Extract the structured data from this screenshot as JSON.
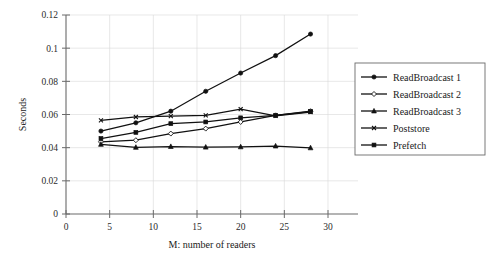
{
  "chart_data": {
    "type": "line",
    "title": "",
    "xlabel": "M: number of readers",
    "ylabel": "Seconds",
    "xlim": [
      0,
      30
    ],
    "ylim": [
      0,
      0.12
    ],
    "xticks": [
      0,
      5,
      10,
      15,
      20,
      25,
      30
    ],
    "yticks": [
      0,
      0.02,
      0.04,
      0.06,
      0.08,
      0.1,
      0.12
    ],
    "xticklabels": [
      "0",
      "5",
      "10",
      "15",
      "20",
      "25",
      "30"
    ],
    "yticklabels": [
      "0",
      "0.02",
      "0.04",
      "0.06",
      "0.08",
      "0.1",
      "0.12"
    ],
    "grid": true,
    "legend_position": "right",
    "x": [
      4,
      8,
      12,
      16,
      20,
      24,
      28
    ],
    "series": [
      {
        "name": "ReadBroadcast 1",
        "marker": "filled-circle",
        "color": "#111111",
        "values": [
          0.05,
          0.055,
          0.062,
          0.074,
          0.085,
          0.0955,
          0.1085
        ]
      },
      {
        "name": "ReadBroadcast 2",
        "marker": "open-diamond",
        "color": "#111111",
        "values": [
          0.0435,
          0.0445,
          0.0485,
          0.0515,
          0.0555,
          0.0595,
          0.062
        ]
      },
      {
        "name": "ReadBroadcast 3",
        "marker": "filled-triangle",
        "color": "#111111",
        "values": [
          0.042,
          0.0402,
          0.0407,
          0.0403,
          0.0405,
          0.041,
          0.0399
        ]
      },
      {
        "name": "Poststore",
        "marker": "small-cross",
        "color": "#111111",
        "values": [
          0.0565,
          0.0585,
          0.059,
          0.0595,
          0.0632,
          0.0592,
          0.0615
        ]
      },
      {
        "name": "Prefetch",
        "marker": "filled-square",
        "color": "#111111",
        "values": [
          0.0455,
          0.0492,
          0.0545,
          0.0555,
          0.058,
          0.0595,
          0.0618
        ]
      }
    ]
  },
  "legend": {
    "entries": [
      {
        "label": "ReadBroadcast 1"
      },
      {
        "label": "ReadBroadcast 2"
      },
      {
        "label": "ReadBroadcast 3"
      },
      {
        "label": "Poststore"
      },
      {
        "label": "Prefetch"
      }
    ]
  },
  "colors": {
    "background": "#ffffff",
    "grid": "#d8d8d8",
    "axis": "#6a6a6a",
    "ink": "#111111"
  }
}
